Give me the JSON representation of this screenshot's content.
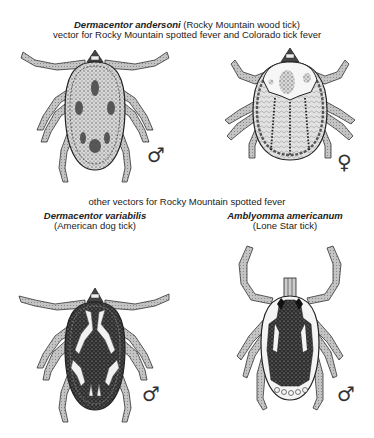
{
  "header": {
    "species": "Dermacentor andersoni",
    "common_name": "(Rocky Mountain wood tick)",
    "subtitle": "vector for Rocky Mountain spotted fever and Colorado tick fever"
  },
  "section2": {
    "title": "other vectors for Rocky Mountain spotted fever"
  },
  "ticks": [
    {
      "species": "Dermacentor andersoni",
      "sex": "male",
      "sex_symbol": "♂"
    },
    {
      "species": "Dermacentor andersoni",
      "sex": "female",
      "sex_symbol": "♀"
    },
    {
      "species": "Dermacentor variabilis",
      "common_name": "(American dog tick)",
      "sex": "male",
      "sex_symbol": "♂"
    },
    {
      "species": "Amblyomma americanum",
      "common_name": "(Lone Star tick)",
      "sex": "male",
      "sex_symbol": "♂"
    }
  ],
  "colors": {
    "ink": "#222222",
    "leg_fill": "#bdbdbd",
    "body_stipple": "#8a8a8a",
    "dark_pattern": "#3a3a3a",
    "pale_pattern": "#f2f2f2"
  }
}
